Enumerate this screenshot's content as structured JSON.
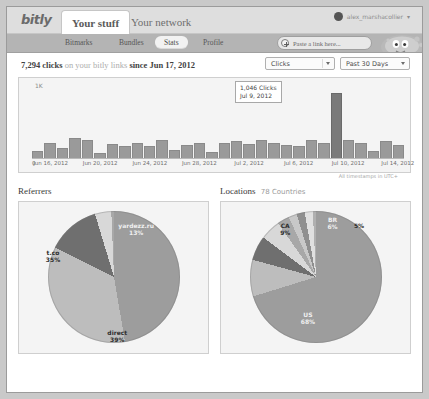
{
  "window": {
    "title": "bitly stats"
  },
  "header": {
    "logo": "bitly",
    "tabs": [
      {
        "label": "Your stuff",
        "active": true
      },
      {
        "label": "Your network",
        "active": false
      }
    ],
    "account": {
      "name": "alex_marshacollier",
      "caret": "▾",
      "avatar_icon": "user-avatar-icon"
    }
  },
  "subnav": {
    "items": [
      {
        "label": "Bitmarks",
        "active": false
      },
      {
        "label": "Bundles",
        "active": false
      },
      {
        "label": "Stats",
        "active": true
      },
      {
        "label": "Profile",
        "active": false
      }
    ],
    "paste": {
      "placeholder": "Paste a link here...",
      "icon": "plus-circle-icon"
    },
    "mascot_icon": "bitly-pufferfish-mascot-icon"
  },
  "summary": {
    "count": "7,294 clicks",
    "middle": "on your bitly links",
    "since": "since Jun 17, 2012",
    "metric_select": {
      "value": "Clicks",
      "options": [
        "Clicks",
        "Referrers",
        "Locations"
      ]
    },
    "range_select": {
      "value": "Past 30 Days",
      "options": [
        "Past 24 Hours",
        "Past 7 Days",
        "Past 30 Days",
        "All time"
      ]
    }
  },
  "timezone_note": "All timestamps in UTC+",
  "tooltip": {
    "value": "1,046 Clicks",
    "date": "Jul 9, 2012"
  },
  "sections": [
    {
      "title": "Referrers",
      "subtitle": "",
      "name": "referrers-section"
    },
    {
      "title": "Locations",
      "subtitle": "78 Countries",
      "name": "locations-section"
    }
  ],
  "chart_data": [
    {
      "type": "bar",
      "title": "Clicks per day",
      "xlabel": "",
      "ylabel": "1K",
      "ylim": [
        0,
        1100
      ],
      "grid": false,
      "legend": "none",
      "axis_zero_label": "0",
      "tick_labels": [
        "Jun 16, 2012",
        "Jun 20, 2012",
        "Jun 24, 2012",
        "Jun 28, 2012",
        "Jul 2, 2012",
        "Jul 6, 2012",
        "Jul 10, 2012",
        "Jul 14, 2012"
      ],
      "x": [
        "Jun 15, 2012",
        "Jun 16, 2012",
        "Jun 17, 2012",
        "Jun 18, 2012",
        "Jun 19, 2012",
        "Jun 20, 2012",
        "Jun 21, 2012",
        "Jun 22, 2012",
        "Jun 23, 2012",
        "Jun 24, 2012",
        "Jun 25, 2012",
        "Jun 26, 2012",
        "Jun 27, 2012",
        "Jun 28, 2012",
        "Jun 29, 2012",
        "Jun 30, 2012",
        "Jul 1, 2012",
        "Jul 2, 2012",
        "Jul 3, 2012",
        "Jul 4, 2012",
        "Jul 5, 2012",
        "Jul 6, 2012",
        "Jul 7, 2012",
        "Jul 8, 2012",
        "Jul 9, 2012",
        "Jul 10, 2012",
        "Jul 11, 2012",
        "Jul 12, 2012",
        "Jul 13, 2012",
        "Jul 14, 2012"
      ],
      "values": [
        120,
        250,
        180,
        330,
        300,
        95,
        240,
        210,
        260,
        200,
        300,
        150,
        230,
        260,
        105,
        250,
        280,
        245,
        300,
        250,
        230,
        210,
        300,
        250,
        1046,
        300,
        260,
        125,
        280,
        230
      ],
      "highlight_index": 24,
      "highlight_value": 1046
    },
    {
      "type": "pie",
      "title": "Referrers",
      "labels": [
        "direct",
        "t.co",
        "yardezz.ru",
        "twitter.com",
        "facebook.com",
        "bitly.com",
        "linkedin.com",
        "reddit.com",
        "other"
      ],
      "values": [
        39,
        35,
        13,
        4,
        3,
        2,
        2,
        1,
        1
      ],
      "display_labels": [
        {
          "text": "direct",
          "pct": "39%"
        },
        {
          "text": "t.co",
          "pct": "35%"
        },
        {
          "text": "yardezz.ru",
          "pct": "13%"
        }
      ]
    },
    {
      "type": "pie",
      "title": "Locations",
      "labels": [
        "US",
        "CA",
        "BR",
        "GB",
        "IN",
        "DE",
        "AU",
        "FR",
        "MX",
        "other"
      ],
      "values": [
        68,
        9,
        6,
        5,
        3,
        2,
        2,
        2,
        1,
        2
      ],
      "display_labels": [
        {
          "text": "US",
          "pct": "68%"
        },
        {
          "text": "CA",
          "pct": "9%"
        },
        {
          "text": "BR",
          "pct": "6%"
        },
        {
          "text": "GB",
          "pct": "5%"
        }
      ]
    }
  ],
  "colors": {
    "page_bg": "#c9c9c9",
    "topbar": "#dedede",
    "subbar": "#b4b4b4",
    "panel": "#f4f4f4",
    "bar": "#9a9a9a",
    "bar_highlight": "#7a7a7a"
  }
}
